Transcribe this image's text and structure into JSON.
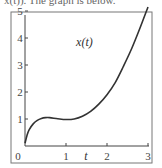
{
  "caption_fragment": "x(t)). The graph is below.",
  "chart_data": {
    "type": "line",
    "title": "",
    "xlabel": "t",
    "ylabel": "",
    "xlim": [
      0,
      3
    ],
    "ylim": [
      0,
      5.3
    ],
    "grid": false,
    "legend": null,
    "annotations": [
      {
        "text": "x(t)",
        "x": 1.45,
        "y": 3.7
      }
    ],
    "x_ticks": [
      0,
      1,
      2,
      3
    ],
    "y_ticks": [
      0,
      1,
      2,
      3,
      4,
      5
    ],
    "x_tick_labels": [
      "0",
      "1",
      "2",
      "3"
    ],
    "y_tick_labels": [
      "0",
      "1",
      "2",
      "3",
      "4",
      "5"
    ],
    "series": [
      {
        "name": "x(t)",
        "color": "#333333",
        "x": [
          0,
          0.05,
          0.1,
          0.2,
          0.3,
          0.4,
          0.5,
          0.6,
          0.8,
          1.0,
          1.2,
          1.4,
          1.6,
          1.8,
          2.0,
          2.2,
          2.4,
          2.6,
          2.8,
          3.0
        ],
        "y": [
          0.1,
          0.4,
          0.6,
          0.82,
          0.95,
          1.02,
          1.05,
          1.05,
          1.01,
          0.98,
          1.0,
          1.1,
          1.28,
          1.55,
          1.9,
          2.35,
          2.95,
          3.6,
          4.35,
          5.15
        ]
      }
    ]
  }
}
